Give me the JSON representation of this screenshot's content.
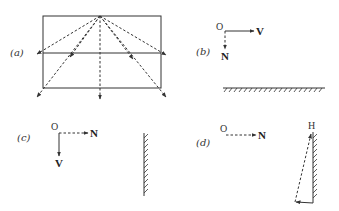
{
  "colors": {
    "ink": "#333333",
    "background": "#ffffff"
  },
  "panels": {
    "a": {
      "label": "(a)",
      "description": "Rectangle with horizontal midline; dashed rays emanate from top-center apex downward and outward with arrowheads"
    },
    "b": {
      "label": "(b)",
      "origin": "O",
      "vector_solid": "V",
      "vector_dashed": "N",
      "surface": "horizontal ground (hatched)"
    },
    "c": {
      "label": "(c)",
      "origin": "O",
      "vector_dashed": "N",
      "vector_solid": "V",
      "surface": "vertical wall (hatched)"
    },
    "d": {
      "label": "(d)",
      "origin": "O",
      "vector_dashed": "N",
      "top_point": "H",
      "surface": "vertical wall (hatched) with dashed diagonal and solid base arrow"
    }
  }
}
